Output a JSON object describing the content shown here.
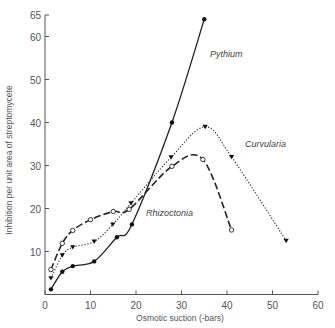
{
  "chart_data": {
    "type": "line",
    "title": "",
    "xlabel": "Osmotic suction (-bars)",
    "ylabel": "Inhibition per unit area of streptomycete",
    "xlim": [
      0,
      60
    ],
    "ylim": [
      0,
      65
    ],
    "x_ticks": [
      0,
      10,
      20,
      30,
      40,
      50,
      60
    ],
    "y_ticks": [
      10,
      20,
      30,
      40,
      50,
      60,
      65
    ],
    "grid": false,
    "legend": "inline labels",
    "series": [
      {
        "name": "Pythium",
        "marker": "filled-circle",
        "line": "solid",
        "x": [
          1.3,
          3.8,
          6.1,
          10.8,
          15.8,
          19.1,
          27.9,
          35
        ],
        "y": [
          1.2,
          5.3,
          6.6,
          7.7,
          13.3,
          16.3,
          40,
          64
        ],
        "label_pos": [
          35,
          58
        ]
      },
      {
        "name": "Curvularia",
        "marker": "filled-triangle-down",
        "line": "dotted",
        "x": [
          1.3,
          3.8,
          6.1,
          10.8,
          14.9,
          18.9,
          27.7,
          35.2,
          41,
          53
        ],
        "y": [
          3.8,
          9.1,
          11,
          12.3,
          16.3,
          21.2,
          31.9,
          39,
          32,
          12.5
        ],
        "label_pos": [
          44,
          35
        ]
      },
      {
        "name": "Rhizoctonia",
        "marker": "open-circle",
        "line": "dashed",
        "x": [
          1.3,
          3.8,
          6.1,
          10,
          15,
          18.5,
          27.9,
          34.7,
          41
        ],
        "y": [
          5.8,
          11.9,
          14.9,
          17.4,
          19.3,
          19.8,
          29.8,
          31.4,
          15
        ],
        "label_pos": [
          23,
          17.5
        ]
      }
    ]
  },
  "labels": {
    "xlabel": "Osmotic suction (-bars)",
    "ylabel": "Inhibition per unit area of streptomycete",
    "pythium": "Pythium",
    "curvularia": "Curvularia",
    "rhizoctonia": "Rhizoctonia"
  }
}
